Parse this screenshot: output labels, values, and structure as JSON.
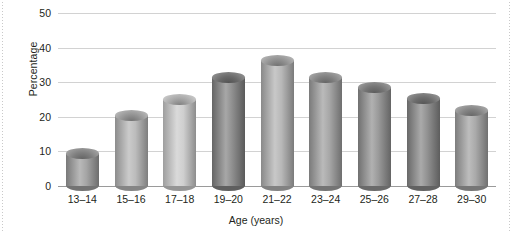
{
  "chart_data": {
    "type": "bar",
    "title": "",
    "subtitle": "",
    "xlabel": "Age (years)",
    "ylabel": "Percentage",
    "categories": [
      "13–14",
      "15–16",
      "17–18",
      "19–20",
      "21–22",
      "23–24",
      "25–26",
      "27–28",
      "29–30"
    ],
    "values": [
      11,
      22,
      26.5,
      33,
      38,
      33,
      30,
      27,
      23.5
    ],
    "ylim": [
      0,
      50
    ],
    "ytick_labels": [
      "0",
      "10",
      "20",
      "30",
      "40",
      "50"
    ],
    "ytick_values": [
      0,
      10,
      20,
      30,
      40,
      50
    ],
    "grid": "horizontal",
    "legend": "none",
    "style": "3d-cylinder",
    "bar_colors": [
      "#9b9b9b",
      "#b4b4b4",
      "#cacaca",
      "#818181",
      "#b0b0b0",
      "#9d9d9d",
      "#8f8f8f",
      "#858585",
      "#a0a0a0"
    ],
    "gridline_color": "#d2d2d2",
    "axis_color": "#9a9a9a",
    "background_color": "#ffffff",
    "text_color": "#231f20"
  }
}
